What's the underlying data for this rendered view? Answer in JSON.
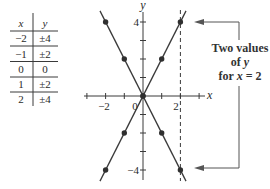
{
  "table": {
    "headers": [
      "x",
      "y"
    ],
    "rows": [
      [
        "−2",
        "±4"
      ],
      [
        "−1",
        "±2"
      ],
      [
        "0",
        "0"
      ],
      [
        "1",
        "±2"
      ],
      [
        "2",
        "±4"
      ]
    ]
  },
  "annotation": {
    "line1": "Two values",
    "line2_prefix": "of ",
    "line2_var": "y",
    "line3_prefix": "for ",
    "line3_var": "x",
    "line3_suffix": " = 2"
  },
  "colors": {
    "ink": "#3a3a3a",
    "annotation": "#555555",
    "background": "#ffffff"
  },
  "chart_data": {
    "type": "scatter",
    "title": "",
    "xlabel": "x",
    "ylabel": "y",
    "xlim": [
      -3.2,
      3.3
    ],
    "ylim": [
      -4.6,
      4.6
    ],
    "grid": false,
    "x_ticks": [
      -3,
      -2,
      -1,
      1,
      2,
      3
    ],
    "y_ticks": [
      -4,
      -3,
      -2,
      -1,
      1,
      2,
      3,
      4
    ],
    "tick_labels": {
      "x_neg2": "−2",
      "x_0": "0",
      "x_2": "2",
      "y_4": "4",
      "y_neg4": "−4"
    },
    "series": [
      {
        "name": "y = 2x",
        "points": [
          [
            -2,
            -4
          ],
          [
            -1,
            -2
          ],
          [
            0,
            0
          ],
          [
            1,
            2
          ],
          [
            2,
            4
          ]
        ],
        "line_extent": [
          -2.3,
          2.3
        ],
        "slope": 2
      },
      {
        "name": "y = -2x",
        "points": [
          [
            -2,
            4
          ],
          [
            -1,
            2
          ],
          [
            0,
            0
          ],
          [
            1,
            -2
          ],
          [
            2,
            -4
          ]
        ],
        "line_extent": [
          -2.3,
          2.3
        ],
        "slope": -2
      }
    ],
    "reference_line": {
      "x": 2,
      "style": "dashed"
    },
    "annotations": [
      {
        "text": "Two values of y for x = 2",
        "targets": [
          [
            2,
            4
          ],
          [
            2,
            -4
          ]
        ]
      }
    ],
    "table": {
      "columns": [
        "x",
        "y"
      ],
      "rows": [
        [
          -2,
          "±4"
        ],
        [
          -1,
          "±2"
        ],
        [
          0,
          "0"
        ],
        [
          1,
          "±2"
        ],
        [
          2,
          "±4"
        ]
      ]
    }
  }
}
